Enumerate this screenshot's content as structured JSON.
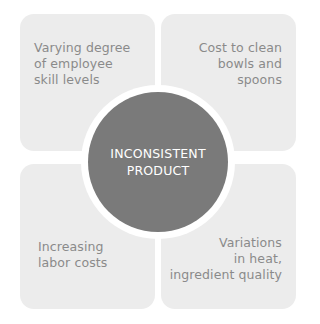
{
  "diagram": {
    "center": {
      "lines": [
        "INCONSISTENT",
        "PRODUCT"
      ],
      "color": "#7a7a7a"
    },
    "quadrants": [
      {
        "position": "top-left",
        "lines": [
          "Varying degree",
          "of employee",
          "skill levels"
        ]
      },
      {
        "position": "top-right",
        "lines": [
          "Cost to clean",
          "bowls and",
          "spoons"
        ]
      },
      {
        "position": "bottom-left",
        "lines": [
          "Increasing",
          "labor costs"
        ]
      },
      {
        "position": "bottom-right",
        "lines": [
          "Variations",
          "in heat,",
          "ingredient quality"
        ]
      }
    ],
    "panel_color": "#ececec",
    "text_color": "#8a8a8a"
  }
}
